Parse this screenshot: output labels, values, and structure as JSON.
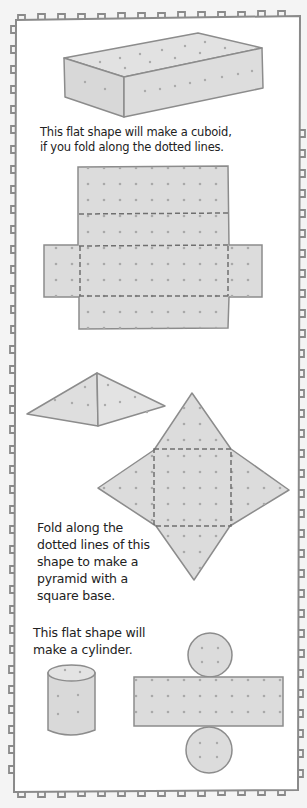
{
  "page": {
    "background": "#f4f4f4",
    "panel_fill": "#ffffff",
    "border_color": "#8a8a8a",
    "shape_fill": "#dcdcdc",
    "shape_stroke": "#8c8c8c",
    "dot_color": "#a9a9a9"
  },
  "sections": [
    {
      "id": "cuboid",
      "caption_lines": [
        "This flat shape will make a cuboid,",
        "if you fold along the dotted lines."
      ],
      "figures": [
        "cuboid-3d",
        "cuboid-net"
      ]
    },
    {
      "id": "pyramid",
      "caption_lines": [
        "Fold along the",
        "dotted lines of this",
        "shape to make a",
        "pyramid with a",
        "square base."
      ],
      "figures": [
        "pyramid-3d",
        "pyramid-net"
      ]
    },
    {
      "id": "cylinder",
      "caption_lines": [
        "This flat shape will",
        "make a cylinder."
      ],
      "figures": [
        "cylinder-3d",
        "cylinder-net"
      ]
    }
  ]
}
